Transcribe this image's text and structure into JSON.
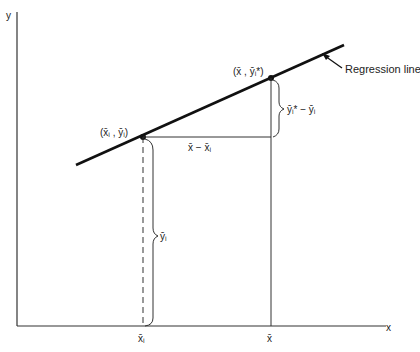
{
  "diagram": {
    "axes": {
      "x_label": "x",
      "y_label": "y"
    },
    "regression_line_label": "Regression line",
    "points": {
      "observed": "(x̄ᵢ , ȳᵢ)",
      "predicted": "(x̄ , ȳᵢ*)"
    },
    "annotations": {
      "horizontal_diff": "x̄ − x̄ᵢ",
      "vertical_diff": "ȳᵢ* − ȳᵢ",
      "height_brace": "ȳᵢ"
    },
    "tick_labels": {
      "xi": "x̄ᵢ",
      "xbar": "x̄"
    },
    "colors": {
      "line": "#111111",
      "axis": "#333333"
    }
  }
}
